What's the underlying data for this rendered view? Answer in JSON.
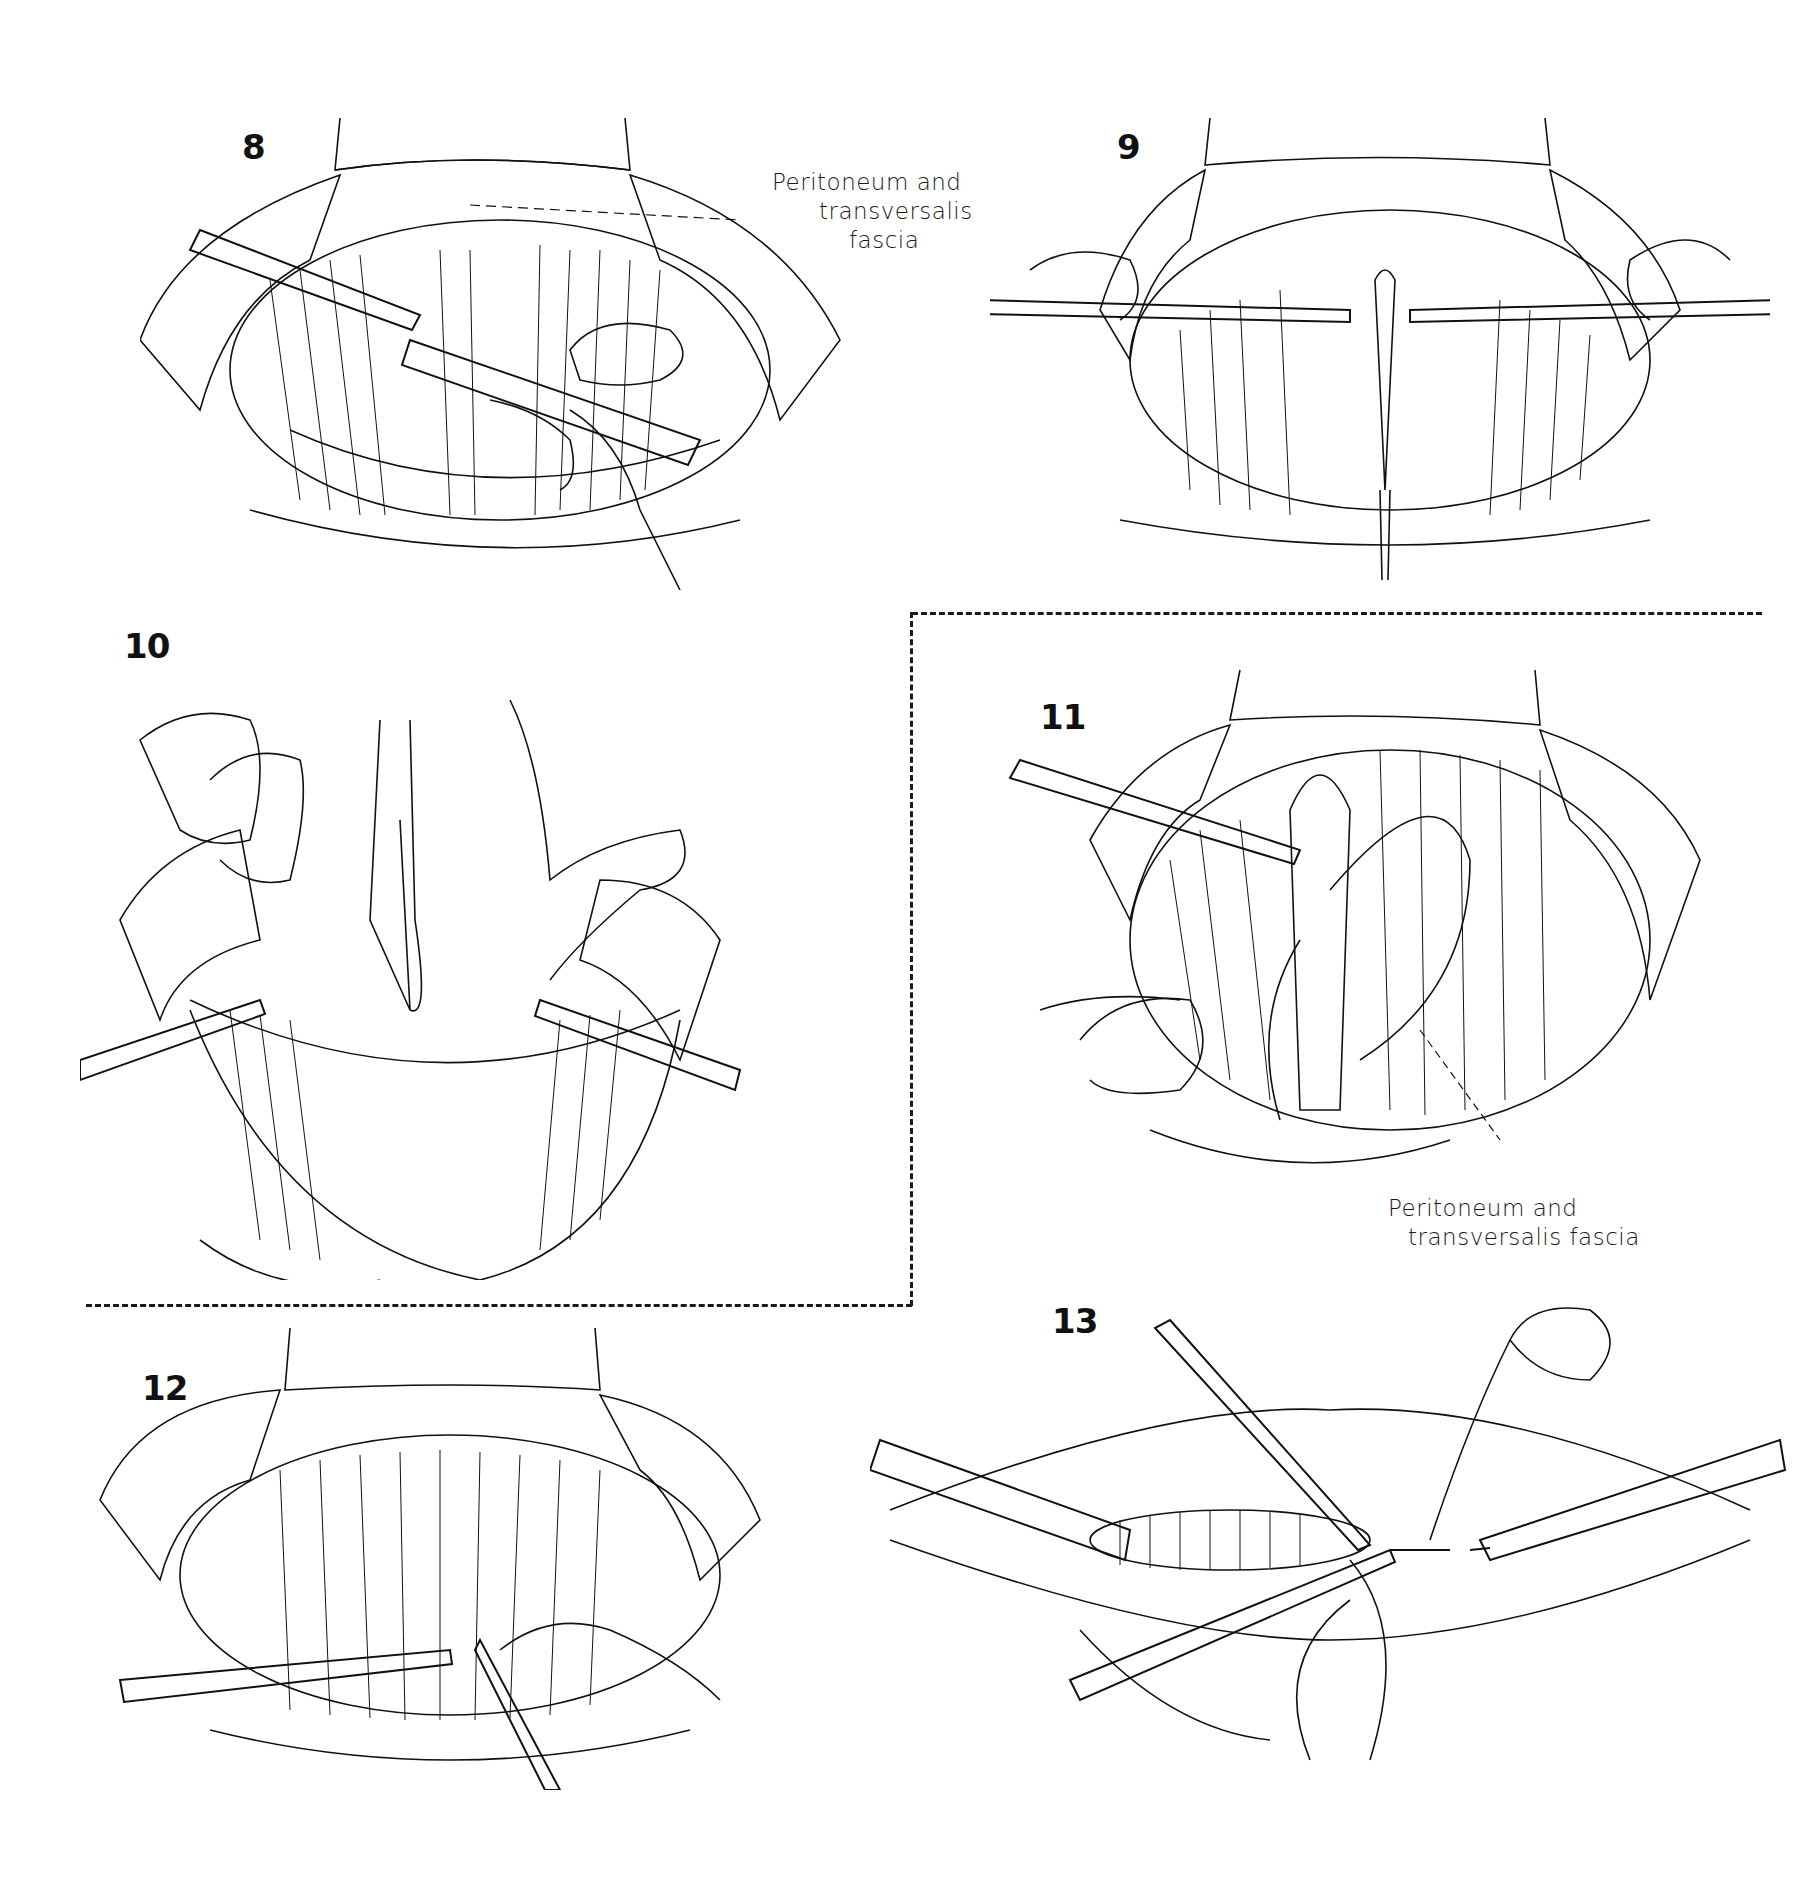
{
  "page": {
    "type": "surgical illustration plate",
    "background": "#ffffff",
    "ink": "#111111"
  },
  "figures": [
    {
      "number": "8",
      "label": "Peritoneum and transversalis fascia",
      "label_lines": [
        "Peritoneum and",
        "transversalis",
        "fascia"
      ]
    },
    {
      "number": "9"
    },
    {
      "number": "10"
    },
    {
      "number": "11",
      "label": "Peritoneum and transversalis fascia",
      "label_lines": [
        "Peritoneum and",
        "transversalis fascia"
      ]
    },
    {
      "number": "12"
    },
    {
      "number": "13"
    }
  ],
  "dashed_box": {
    "encloses": [
      "10",
      "11"
    ]
  }
}
